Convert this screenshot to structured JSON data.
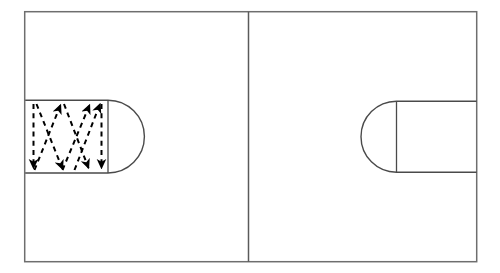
{
  "figure": {
    "title": "",
    "type": "technical-diagram",
    "background_color": "#ffffff",
    "outer_frame": {
      "name": "outer-border",
      "x": 24,
      "y": 11,
      "width": 453,
      "height": 251,
      "stroke": "#6e6e6e",
      "stroke_width": 1.4,
      "fill": "none"
    },
    "divider": {
      "name": "center-divider",
      "x": 248,
      "y_top": 11,
      "y_bottom": 262,
      "stroke": "#5a5a5a",
      "stroke_width": 1.4
    },
    "panels": [
      {
        "id": "left-panel",
        "label": "",
        "shape": {
          "name": "capsule-region",
          "orientation": "round-cap-right",
          "rect_x": 25,
          "rect_y": 100,
          "rect_width": 83,
          "rect_height": 73,
          "cap_center_x": 108,
          "cap_radius": 36.5,
          "stroke": "#4a4a4a",
          "stroke_width": 1.3,
          "fill": "none"
        },
        "cap_divider": {
          "name": "cap-divider-line",
          "x": 108,
          "y_top": 100,
          "y_bottom": 173,
          "stroke": "#4a4a4a",
          "stroke_width": 1.2
        },
        "path_overlay": {
          "name": "zigzag-scan-path",
          "style": "dashed",
          "stroke": "#000000",
          "stroke_width": 2.0,
          "dash_pattern": "5,4",
          "arrowheads": 7,
          "segments": [
            {
              "name": "segment-down-1",
              "x1": 33,
              "y1": 103,
              "x2": 33,
              "y2": 170,
              "direction": "down"
            },
            {
              "name": "segment-up-diag-1",
              "x1": 33,
              "y1": 170,
              "x2": 62,
              "y2": 103,
              "direction": "up-right"
            },
            {
              "name": "segment-down-diag-1",
              "x1": 62,
              "y1": 103,
              "x2": 33,
              "y2": 170,
              "direction": "down-left"
            },
            {
              "name": "segment-up-diag-2",
              "x1": 33,
              "y1": 170,
              "x2": 62,
              "y2": 103,
              "direction": "up-right"
            },
            {
              "name": "segment-down-diag-2",
              "x1": 62,
              "y1": 103,
              "x2": 88,
              "y2": 170,
              "direction": "down-right"
            },
            {
              "name": "segment-up-diag-3",
              "x1": 88,
              "y1": 170,
              "x2": 101,
              "y2": 103,
              "direction": "up-right"
            },
            {
              "name": "segment-down-vert-2",
              "x1": 101,
              "y1": 103,
              "x2": 101,
              "y2": 170,
              "direction": "down"
            }
          ]
        }
      },
      {
        "id": "right-panel",
        "label": "",
        "shape": {
          "name": "capsule-region",
          "orientation": "round-cap-left",
          "rect_x": 396,
          "rect_y": 101,
          "rect_width": 81,
          "rect_height": 71,
          "cap_center_x": 396,
          "cap_radius": 35.5,
          "stroke": "#4a4a4a",
          "stroke_width": 1.3,
          "fill": "none"
        },
        "cap_divider": {
          "name": "cap-divider-line",
          "x": 396,
          "y_top": 101,
          "y_bottom": 172,
          "stroke": "#4a4a4a",
          "stroke_width": 1.2
        },
        "path_overlay": null
      }
    ]
  }
}
